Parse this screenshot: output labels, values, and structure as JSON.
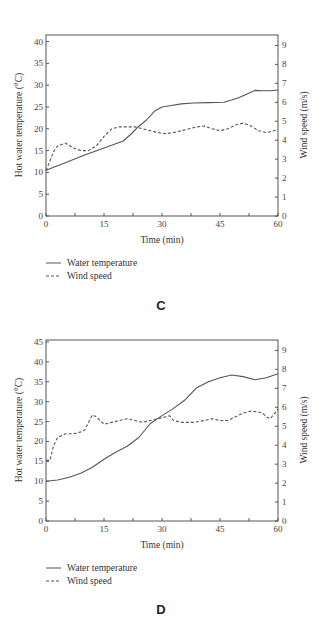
{
  "chart_data": [
    {
      "type": "line",
      "panel_label": "C",
      "xlabel": "Time (min)",
      "ylabel": "Hot water temperature (°C)",
      "y2label": "Wind speed (m/s)",
      "xlim": [
        0,
        60
      ],
      "ylim": [
        0,
        41.5
      ],
      "y2lim": [
        0,
        9.55
      ],
      "xticks": [
        0,
        15,
        30,
        45,
        60
      ],
      "yticks": [
        0,
        5,
        10,
        15,
        20,
        25,
        30,
        35,
        40
      ],
      "y2ticks": [
        0,
        1,
        2,
        3,
        4,
        5,
        6,
        7,
        8,
        9
      ],
      "grid": false,
      "legend_position": "below",
      "series": [
        {
          "name": "Water temperature",
          "style": "solid",
          "axis": "left",
          "x": [
            0,
            5,
            10,
            15,
            20,
            22,
            24,
            26,
            28,
            30,
            32,
            35,
            38,
            42,
            46,
            48,
            50,
            52,
            54,
            56,
            58,
            60
          ],
          "y": [
            10.5,
            12.2,
            14.0,
            15.6,
            17.2,
            18.8,
            20.6,
            22.0,
            24.0,
            25.0,
            25.3,
            25.7,
            25.9,
            26.0,
            26.1,
            26.6,
            27.2,
            28.0,
            28.8,
            28.7,
            28.7,
            28.9
          ]
        },
        {
          "name": "Wind speed",
          "style": "dashed",
          "axis": "right",
          "x": [
            0,
            1,
            2,
            3,
            5,
            7,
            9,
            11,
            13,
            15,
            17,
            19,
            21,
            23,
            25,
            27,
            29,
            31,
            33,
            35,
            37,
            39,
            41,
            43,
            45,
            47,
            49,
            51,
            53,
            55,
            57,
            59,
            60
          ],
          "y": [
            2.4,
            2.9,
            3.4,
            3.7,
            3.85,
            3.6,
            3.45,
            3.45,
            3.7,
            4.2,
            4.6,
            4.7,
            4.7,
            4.7,
            4.6,
            4.5,
            4.4,
            4.35,
            4.4,
            4.5,
            4.6,
            4.7,
            4.75,
            4.6,
            4.5,
            4.6,
            4.8,
            4.9,
            4.75,
            4.5,
            4.4,
            4.5,
            4.55
          ]
        }
      ]
    },
    {
      "type": "line",
      "panel_label": "D",
      "xlabel": "Time (min)",
      "ylabel": "Hot water temperature (°C)",
      "y2label": "Wind speed (m/s)",
      "xlim": [
        0,
        60
      ],
      "ylim": [
        0,
        45.5
      ],
      "y2lim": [
        0,
        9.55
      ],
      "xticks": [
        0,
        15,
        30,
        45,
        60
      ],
      "yticks": [
        0,
        5,
        10,
        15,
        20,
        25,
        30,
        35,
        40,
        45
      ],
      "y2ticks": [
        0,
        1,
        2,
        3,
        4,
        5,
        6,
        7,
        8,
        9
      ],
      "grid": false,
      "legend_position": "below",
      "series": [
        {
          "name": "Water temperature",
          "style": "solid",
          "axis": "left",
          "x": [
            0,
            3,
            6,
            9,
            12,
            15,
            18,
            21,
            24,
            27,
            30,
            33,
            36,
            39,
            42,
            45,
            48,
            51,
            54,
            57,
            60
          ],
          "y": [
            10.0,
            10.3,
            11.0,
            12.0,
            13.5,
            15.5,
            17.3,
            18.8,
            21.0,
            24.5,
            26.5,
            28.3,
            30.5,
            33.5,
            35.0,
            36.0,
            36.7,
            36.3,
            35.5,
            36.0,
            37.0
          ]
        },
        {
          "name": "Wind speed",
          "style": "dashed",
          "axis": "right",
          "x": [
            0,
            1,
            2,
            3,
            5,
            7,
            9,
            10,
            11,
            12,
            13,
            15,
            17,
            19,
            21,
            23,
            25,
            27,
            29,
            31,
            32,
            33,
            35,
            38,
            41,
            43,
            45,
            47,
            49,
            51,
            53,
            55,
            56,
            57,
            58,
            60
          ],
          "y": [
            3.2,
            3.2,
            4.0,
            4.4,
            4.6,
            4.6,
            4.7,
            4.8,
            5.2,
            5.6,
            5.5,
            5.1,
            5.2,
            5.3,
            5.4,
            5.3,
            5.2,
            5.3,
            5.4,
            5.5,
            5.55,
            5.3,
            5.2,
            5.2,
            5.3,
            5.4,
            5.3,
            5.3,
            5.5,
            5.7,
            5.8,
            5.75,
            5.7,
            5.5,
            5.4,
            5.9
          ]
        }
      ]
    }
  ],
  "charts": [
    {
      "panel_label": "C",
      "xlabel": "Time (min)",
      "ylabel": "Hot water temperature (°C)",
      "y2label": "Wind speed (m/s)",
      "legend": [
        {
          "label": "Water temperature",
          "style": "solid"
        },
        {
          "label": "Wind speed",
          "style": "dashed"
        }
      ]
    },
    {
      "panel_label": "D",
      "xlabel": "Time (min)",
      "ylabel": "Hot water temperature (°C)",
      "y2label": "Wind speed (m/s)",
      "legend": [
        {
          "label": "Water temperature",
          "style": "solid"
        },
        {
          "label": "Wind speed",
          "style": "dashed"
        }
      ]
    }
  ],
  "colors": {
    "axis": "#555555",
    "line": "#555555",
    "text": "#333333"
  }
}
